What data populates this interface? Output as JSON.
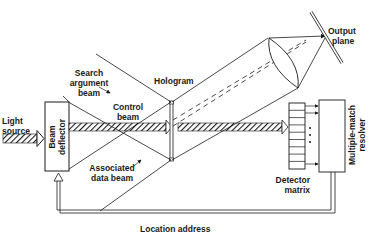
{
  "diagram": {
    "title": "",
    "labels": {
      "light_source_1": "Light",
      "light_source_2": "source",
      "beam_deflector_1": "Beam",
      "beam_deflector_2": "deflector",
      "search_argument_1": "Search",
      "search_argument_2": "argument",
      "search_argument_3": "beam",
      "control_beam_1": "Control",
      "control_beam_2": "beam",
      "hologram": "Hologram",
      "associated_data_1": "Associated",
      "associated_data_2": "data beam",
      "output_plane_1": "Output",
      "output_plane_2": "plane",
      "detector_matrix_1": "Detector",
      "detector_matrix_2": "matrix",
      "resolver_1": "Multiple-match",
      "resolver_2": "resolver",
      "location_address": "Location address"
    },
    "colors": {
      "line": "#1a1a1a",
      "background": "#ffffff"
    },
    "components": [
      "Light source",
      "Beam deflector",
      "Hologram",
      "Lens",
      "Output plane",
      "Detector matrix",
      "Multiple-match resolver"
    ]
  }
}
